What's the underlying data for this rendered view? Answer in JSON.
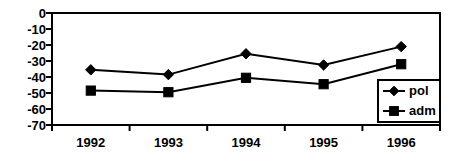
{
  "chart_data": {
    "type": "line",
    "title": "",
    "subtitle": "",
    "xlabel": "",
    "ylabel": "",
    "categories": [
      "1992",
      "1993",
      "1994",
      "1995",
      "1996"
    ],
    "series": [
      {
        "name": "pol",
        "marker": "diamond",
        "values": [
          -35.5,
          -38.5,
          -25.5,
          -32.5,
          -21.0
        ]
      },
      {
        "name": "adm",
        "marker": "square",
        "values": [
          -48.5,
          -49.5,
          -40.5,
          -44.5,
          -32.0
        ]
      }
    ],
    "ylim": [
      -70,
      0
    ],
    "ytick_labels": [
      "0",
      "-10",
      "-20",
      "-30",
      "-40",
      "-50",
      "-60",
      "-70"
    ],
    "ytick_values": [
      0,
      -10,
      -20,
      -30,
      -40,
      -50,
      -60,
      -70
    ],
    "grid": false,
    "legend_position": "bottom-right",
    "legend_entries": [
      "pol",
      "adm"
    ],
    "colors": {
      "line": "#000000",
      "marker": "#000000",
      "axis": "#000000",
      "background": "#ffffff"
    }
  }
}
